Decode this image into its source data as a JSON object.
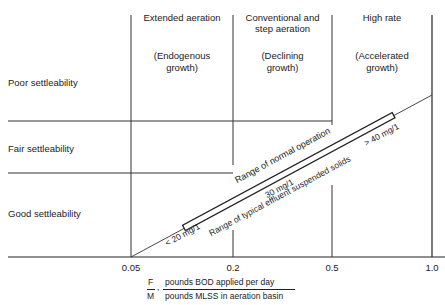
{
  "diagram": {
    "regions": [
      {
        "title": "Extended aeration",
        "subtitle_line1": "(Endogenous",
        "subtitle_line2": "growth)"
      },
      {
        "title_line1": "Conventional and",
        "title_line2": "step aeration",
        "subtitle_line1": "(Declining",
        "subtitle_line2": "growth)"
      },
      {
        "title": "High rate",
        "subtitle_line1": "(Accelerated",
        "subtitle_line2": "growth)"
      }
    ],
    "settleability": {
      "poor": "Poor settleability",
      "fair": "Fair settleability",
      "good": "Good settleability"
    },
    "x_ticks": [
      "0.05",
      "0.2",
      "0.5",
      "1.0"
    ],
    "band": {
      "upper_label": "Range of normal operation",
      "lower_label": "Range of typical effluent suspended solids",
      "low_value": "< 20 mg/1",
      "mid_value": "30 mg/1",
      "high_value": "> 40 mg/1"
    },
    "x_axis": {
      "fm_numerator": "F",
      "fm_denominator": "M",
      "separator": ",",
      "numerator_text": "pounds BOD applied per day",
      "denominator_text": "pounds MLSS in aeration basin"
    },
    "colors": {
      "line": "#222222",
      "background": "#ffffff"
    }
  }
}
